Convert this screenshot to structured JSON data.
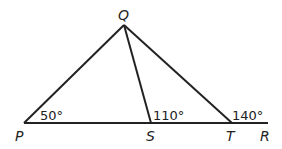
{
  "diagram": {
    "points": {
      "Q": {
        "label": "Q"
      },
      "P": {
        "label": "P"
      },
      "S": {
        "label": "S"
      },
      "T": {
        "label": "T"
      },
      "R": {
        "label": "R"
      }
    },
    "angles": {
      "P": "50°",
      "S": "110°",
      "T": "140°"
    },
    "segments": [
      "PQ",
      "QS",
      "QT",
      "PR"
    ],
    "colors": {
      "stroke": "#222222",
      "background": "#ffffff"
    }
  }
}
